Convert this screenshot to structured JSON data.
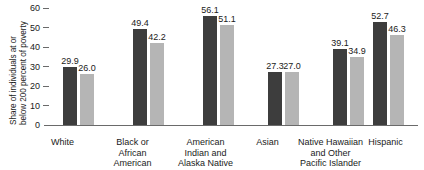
{
  "chart_data": {
    "type": "bar",
    "title": "",
    "xlabel": "",
    "ylabel_line1": "Share of individuals at or",
    "ylabel_line2": "below 200 percent of poverty",
    "ylim": [
      0,
      60
    ],
    "yticks": [
      "60",
      "50",
      "40",
      "30",
      "20",
      "10",
      "0"
    ],
    "ytick_values": [
      60,
      50,
      40,
      30,
      20,
      10,
      0
    ],
    "grid": false,
    "legend": "none",
    "categories": [
      "White",
      "Black or\nAfrican\nAmerican",
      "American\nIndian and\nAlaska Native",
      "Asian",
      "Native Hawaiian\nand Other\nPacific Islander",
      "Hispanic"
    ],
    "series": [
      {
        "name": "series-1-dark",
        "color": "#3d3d3d",
        "values": [
          29.9,
          49.4,
          56.1,
          27.3,
          39.1,
          52.7
        ],
        "labels": [
          "29.9",
          "49.4",
          "56.1",
          "27.3",
          "39.1",
          "52.7"
        ]
      },
      {
        "name": "series-2-light",
        "color": "#b5b5b5",
        "values": [
          26.0,
          42.2,
          51.1,
          27.0,
          34.9,
          46.3
        ],
        "labels": [
          "26.0",
          "42.2",
          "51.1",
          "27.0",
          "34.9",
          "46.3"
        ]
      }
    ]
  },
  "layout": {
    "group_left_px": [
      8,
      78,
      148,
      213,
      278,
      318
    ],
    "group_label_left_px": [
      -30,
      40,
      108,
      175,
      228,
      288
    ],
    "group_label_width_px": [
      75,
      75,
      85,
      75,
      95,
      85
    ],
    "axis_color": "#6a6a6a",
    "background": "#ffffff"
  }
}
